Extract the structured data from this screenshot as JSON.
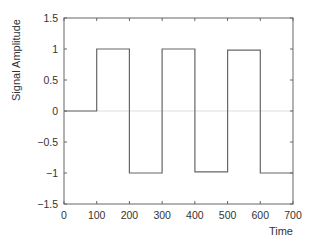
{
  "chart_data": {
    "type": "line",
    "style": "step",
    "title": "",
    "xlabel": "Time",
    "ylabel": "Signal Amplitude",
    "xlim": [
      0,
      700
    ],
    "ylim": [
      -1.5,
      1.5
    ],
    "xticks": [
      0,
      100,
      200,
      300,
      400,
      500,
      600,
      700
    ],
    "xtick_labels": [
      "0",
      "100",
      "200",
      "300",
      "400",
      "500",
      "600",
      "700"
    ],
    "yticks": [
      -1.5,
      -1,
      -0.5,
      0,
      0.5,
      1,
      1.5
    ],
    "ytick_labels": [
      "−1.5",
      "−1",
      "−0.5",
      "0",
      "0.5",
      "1",
      "1.5"
    ],
    "grid": false,
    "zero_line": true,
    "legend": null,
    "series": [
      {
        "name": "signal",
        "color": "#666666",
        "x": [
          0,
          100,
          100,
          200,
          200,
          300,
          300,
          400,
          400,
          500,
          500,
          600,
          600,
          700
        ],
        "values": [
          0,
          0,
          1,
          1,
          -1,
          -1,
          1,
          1,
          -0.98,
          -0.98,
          0.98,
          0.98,
          -1,
          -1
        ]
      }
    ]
  },
  "colors": {
    "axis": "#666666",
    "zero_line": "#dddddd",
    "text": "#333333"
  }
}
